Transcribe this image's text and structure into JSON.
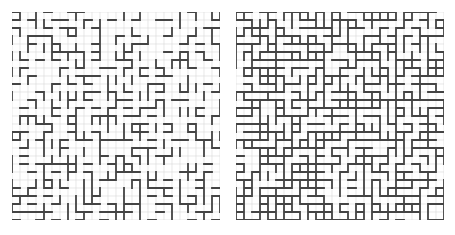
{
  "figure": {
    "panels": [
      {
        "id": "left",
        "grid_cells": 26,
        "density": 0.32,
        "seed": 7
      },
      {
        "id": "right",
        "grid_cells": 26,
        "density": 0.62,
        "seed": 19
      }
    ],
    "colors": {
      "grid": "#d9d9d9",
      "path": "#444444",
      "background": "#ffffff"
    }
  }
}
